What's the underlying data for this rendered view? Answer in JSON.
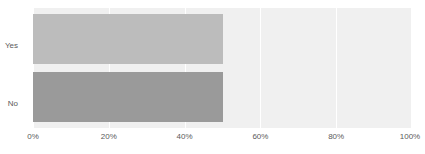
{
  "chart_data": {
    "type": "bar",
    "orientation": "horizontal",
    "title": "",
    "subtitle": "",
    "xlabel": "",
    "ylabel": "",
    "categories": [
      "Yes",
      "No"
    ],
    "values": [
      50,
      50
    ],
    "series": [
      {
        "name": "Response share",
        "values": [
          50,
          50
        ]
      }
    ],
    "xlim": [
      0,
      100
    ],
    "xticks": [
      0,
      20,
      40,
      60,
      80,
      100
    ],
    "xticklabels": [
      "0%",
      "20%",
      "40%",
      "60%",
      "80%",
      "100%"
    ],
    "yticklabels": [
      "Yes",
      "No"
    ],
    "grid": true,
    "grid_axis": "x",
    "legend": false,
    "legend_position": "none",
    "annotations": [],
    "colors": {
      "bar_yes": "#bcbcbc",
      "bar_no": "#9a9a9a",
      "plot_background": "#f0f0f0",
      "gridline": "#ffffff",
      "page_background": "#ffffff",
      "tick_label": "#5a5a5a"
    }
  },
  "axis": {
    "x_ticks": [
      {
        "label": "0%",
        "value": 0
      },
      {
        "label": "20%",
        "value": 20
      },
      {
        "label": "40%",
        "value": 40
      },
      {
        "label": "60%",
        "value": 60
      },
      {
        "label": "80%",
        "value": 80
      },
      {
        "label": "100%",
        "value": 100
      }
    ],
    "y_ticks": [
      {
        "label": "Yes"
      },
      {
        "label": "No"
      }
    ]
  }
}
